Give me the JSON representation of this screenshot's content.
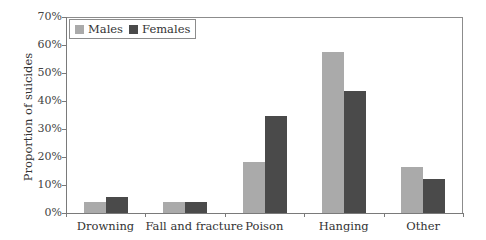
{
  "chart_data": {
    "type": "bar",
    "title": "",
    "xlabel": "",
    "ylabel": "Proportion of suicides",
    "ylim": [
      0,
      70
    ],
    "yticks": [
      "0%",
      "10%",
      "20%",
      "30%",
      "40%",
      "50%",
      "60%",
      "70%"
    ],
    "categories": [
      "Drowning",
      "Fall and fracture",
      "Poison",
      "Hanging",
      "Other"
    ],
    "series": [
      {
        "name": "Males",
        "color": "#aaaaaa",
        "values": [
          3.9,
          3.9,
          18.2,
          57.5,
          16.4
        ]
      },
      {
        "name": "Females",
        "color": "#4a4a4a",
        "values": [
          5.7,
          3.9,
          34.6,
          43.5,
          12.1
        ]
      }
    ],
    "legend_position": "top-left, inside",
    "grid": false
  },
  "legend": {
    "males_label": "Males",
    "females_label": "Females"
  },
  "axis": {
    "ylabel": "Proportion of suicides"
  }
}
